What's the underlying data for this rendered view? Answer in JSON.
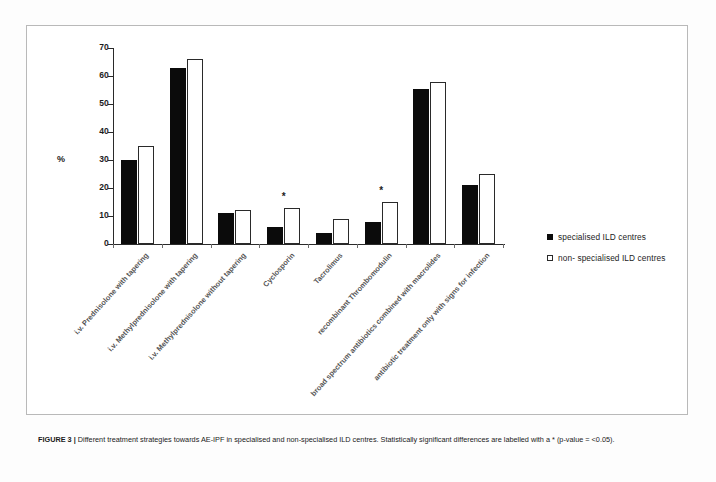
{
  "figure": {
    "caption_label": "FIGURE 3 |",
    "caption_text": " Different treatment strategies towards AE-IPF in specialised and non-specialised ILD centres. Statistically significant differences are labelled with a * (p-value = <0.05)."
  },
  "legend": {
    "position": "right",
    "items": [
      {
        "swatch": "dark",
        "label": "specialised ILD centres"
      },
      {
        "swatch": "light",
        "label": "non- specialised ILD centres"
      }
    ]
  },
  "chart_data": {
    "type": "bar",
    "title": "",
    "subtitle": "",
    "xlabel": "",
    "ylabel": "%",
    "ylim": [
      0,
      70
    ],
    "yticks": [
      0,
      10,
      20,
      30,
      40,
      50,
      60,
      70
    ],
    "ytick_labels": [
      "0",
      "10",
      "20",
      "30",
      "40",
      "50",
      "60",
      "70"
    ],
    "grid": false,
    "legend_position": "right",
    "categories": [
      "i.v. Prednisolone with tapering",
      "i.v. Methylprednisolone with tapering",
      "i.v. Methylprednisolone without tapering",
      "Cyclosporin",
      "Tacrolimus",
      "recombinant Thrombomodulin",
      "broad spectrum antibiotics combined with macrolides",
      "antibiotic treatment only with signs for infection"
    ],
    "series": [
      {
        "name": "specialised ILD centres",
        "color": "#0b0b0b",
        "values": [
          30,
          63,
          11,
          6,
          4,
          8,
          55.5,
          21
        ]
      },
      {
        "name": "non- specialised ILD centres",
        "color": "#ffffff",
        "values": [
          35,
          66,
          12,
          13,
          9,
          15,
          58,
          25
        ]
      }
    ],
    "annotations": [
      {
        "category": "Cyclosporin",
        "marker": "*",
        "meaning": "statistically significant (p < 0.05)"
      },
      {
        "category": "recombinant Thrombomodulin",
        "marker": "*",
        "meaning": "statistically significant (p < 0.05)"
      }
    ]
  }
}
